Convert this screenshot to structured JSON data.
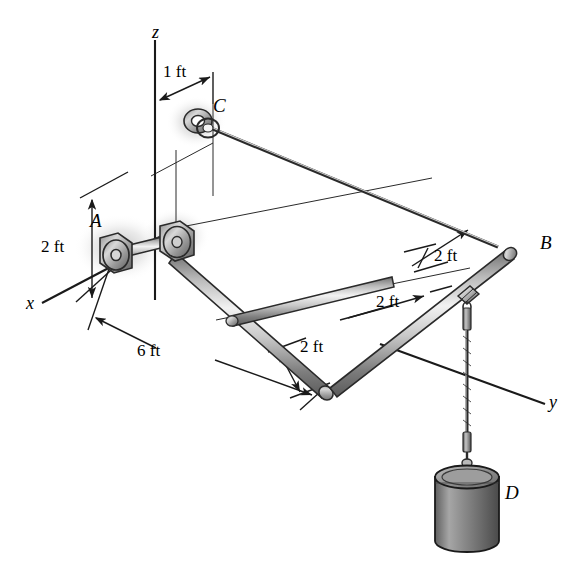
{
  "figure": {
    "background_color": "#ffffff",
    "line_color": "#1a1a1a",
    "metal_light": "#e8e8e8",
    "metal_mid": "#9a9a9a",
    "metal_dark": "#4a4a4a",
    "shadow_color": "#b8b8b8"
  },
  "axes": [
    {
      "name": "z-axis",
      "label": "z",
      "direction": "up"
    },
    {
      "name": "x-axis",
      "label": "x",
      "direction": "down-left"
    },
    {
      "name": "y-axis",
      "label": "y",
      "direction": "down-right"
    }
  ],
  "points": [
    {
      "name": "point-a",
      "label": "A",
      "description": "bearing support on rod"
    },
    {
      "name": "point-b",
      "label": "B",
      "description": "cable attachment at far rod end"
    },
    {
      "name": "point-c",
      "label": "C",
      "description": "eyebolt anchor on vertical wall"
    },
    {
      "name": "point-d",
      "label": "D",
      "description": "suspended cylindrical weight"
    }
  ],
  "dimensions": [
    {
      "name": "dim-1ft-top",
      "label": "1 ft",
      "axis": "horizontal offset of C from z-axis"
    },
    {
      "name": "dim-2ft-height",
      "label": "2 ft",
      "axis": "vertical height of A below C level"
    },
    {
      "name": "dim-2ft-b-offset",
      "label": "2 ft",
      "axis": "offset near B"
    },
    {
      "name": "dim-2ft-middle",
      "label": "2 ft",
      "axis": "middle span along rod"
    },
    {
      "name": "dim-2ft-cross",
      "label": "2 ft",
      "axis": "cross-member length"
    },
    {
      "name": "dim-6ft-long",
      "label": "6 ft",
      "axis": "long rod span from A"
    }
  ],
  "members": [
    {
      "name": "rod-ab",
      "description": "main horizontal rod from bearing A to end B"
    },
    {
      "name": "rod-cross",
      "description": "perpendicular cross rod segment"
    },
    {
      "name": "cable-cb",
      "description": "straight tension cable from C to B"
    },
    {
      "name": "cable-d",
      "description": "braided vertical cable carrying weight D"
    }
  ]
}
